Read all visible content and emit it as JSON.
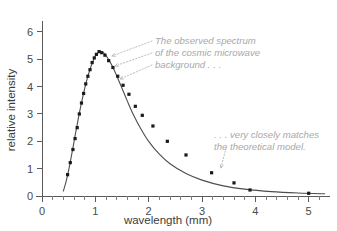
{
  "chart_data": {
    "type": "line",
    "title": "",
    "xlabel": "wavelength (mm)",
    "ylabel": "relative intensity",
    "xlim": [
      0,
      5.4
    ],
    "ylim": [
      0,
      6.4
    ],
    "grid": false,
    "legend_position": "none",
    "x_ticks": [
      "0",
      "1",
      "2",
      "3",
      "4",
      "5"
    ],
    "x_tick_values": [
      0,
      1,
      2,
      3,
      4,
      5
    ],
    "x_minor_per_major": 5,
    "y_ticks": [
      "0",
      "1",
      "2",
      "3",
      "4",
      "5",
      "6"
    ],
    "y_tick_values": [
      0,
      1,
      2,
      3,
      4,
      5,
      6
    ],
    "series": [
      {
        "name": "theoretical model",
        "kind": "line",
        "x": [
          0.4,
          0.45,
          0.5,
          0.55,
          0.6,
          0.65,
          0.7,
          0.75,
          0.8,
          0.85,
          0.9,
          0.95,
          1.0,
          1.05,
          1.1,
          1.15,
          1.2,
          1.3,
          1.4,
          1.5,
          1.6,
          1.7,
          1.85,
          2.0,
          2.2,
          2.4,
          2.7,
          3.0,
          3.4,
          3.8,
          4.3,
          4.8,
          5.3
        ],
        "y": [
          0.18,
          0.52,
          0.95,
          1.45,
          1.98,
          2.52,
          3.03,
          3.5,
          3.93,
          4.31,
          4.63,
          4.9,
          5.12,
          5.24,
          5.28,
          5.24,
          5.14,
          4.82,
          4.4,
          3.94,
          3.47,
          3.03,
          2.47,
          2.0,
          1.53,
          1.18,
          0.82,
          0.58,
          0.37,
          0.25,
          0.16,
          0.11,
          0.08
        ]
      },
      {
        "name": "observed spectrum",
        "kind": "points",
        "x": [
          0.48,
          0.53,
          0.58,
          0.62,
          0.66,
          0.7,
          0.74,
          0.78,
          0.82,
          0.86,
          0.9,
          0.94,
          0.98,
          1.02,
          1.07,
          1.12,
          1.18,
          1.25,
          1.33,
          1.42,
          1.52,
          1.63,
          1.75,
          1.88,
          2.08,
          2.35,
          2.7,
          3.18,
          3.6,
          3.9,
          5.0
        ],
        "y": [
          0.78,
          1.22,
          1.7,
          2.1,
          2.5,
          3.0,
          3.4,
          3.75,
          4.1,
          4.38,
          4.62,
          4.88,
          5.05,
          5.18,
          5.28,
          5.24,
          5.15,
          4.95,
          4.7,
          4.38,
          4.05,
          3.72,
          3.28,
          2.95,
          2.56,
          2.0,
          1.5,
          0.85,
          0.48,
          0.22,
          0.1
        ]
      }
    ],
    "annotations": [
      {
        "id": "observed-annotation",
        "lines": [
          "The observed spectrum",
          "of the cosmic microwave",
          "background . . ."
        ],
        "x": 155,
        "y": 44
      },
      {
        "id": "model-annotation",
        "lines": [
          ". . . very closely matches",
          "the theoretical model."
        ],
        "x": 214,
        "y": 138
      }
    ]
  },
  "colors": {
    "axis": "#5b5b5b",
    "curve": "#4d4d4d",
    "point": "#1a1a1a",
    "annotation": "#a8a8a8",
    "leader": "#b4b4b4",
    "background": "#ffffff"
  }
}
